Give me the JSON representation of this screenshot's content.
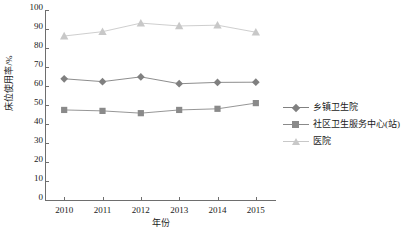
{
  "chart_data": {
    "type": "line",
    "title": "",
    "xlabel": "年份",
    "ylabel": "床位使用率/%",
    "categories": [
      "2010",
      "2011",
      "2012",
      "2013",
      "2014",
      "2015"
    ],
    "x": [
      2010,
      2011,
      2012,
      2013,
      2014,
      2015
    ],
    "ylim": [
      0,
      100
    ],
    "yticks": [
      0,
      10,
      20,
      30,
      40,
      50,
      60,
      70,
      80,
      90,
      100
    ],
    "grid": false,
    "legend_position": "right",
    "series": [
      {
        "name": "乡镇卫生院",
        "marker": "diamond",
        "color": "#808080",
        "values": [
          63.8,
          62.3,
          64.8,
          61.2,
          61.9,
          62.0
        ]
      },
      {
        "name": "社区卫生服务中心(站)",
        "marker": "square",
        "color": "#8a8a8a",
        "values": [
          47.4,
          46.9,
          45.7,
          47.4,
          48.0,
          51.0
        ]
      },
      {
        "name": "医院",
        "marker": "triangle",
        "color": "#c8c8c8",
        "values": [
          86.3,
          88.6,
          93.1,
          91.6,
          92.0,
          88.3
        ]
      }
    ]
  },
  "axis": {
    "y_tick_labels": [
      "100",
      "90",
      "80",
      "70",
      "60",
      "50",
      "40",
      "30",
      "20",
      "10",
      "0"
    ],
    "x_tick_labels": [
      "2010",
      "2011",
      "2012",
      "2013",
      "2014",
      "2015"
    ]
  },
  "legend": {
    "items": [
      {
        "label": "乡镇卫生院"
      },
      {
        "label": "社区卫生服务中心(站)"
      },
      {
        "label": "医院"
      }
    ]
  }
}
